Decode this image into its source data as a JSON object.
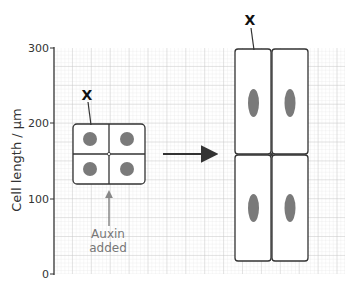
{
  "axis": {
    "ylabel": "Cell length / µm",
    "ticks": [
      "0",
      "100",
      "200",
      "300"
    ]
  },
  "labels": {
    "x_small": "X",
    "x_large": "X",
    "auxin_line1": "Auxin",
    "auxin_line2": "added"
  },
  "colors": {
    "grid_minor": "#e2e2e2",
    "grid_major": "#bdbdbd",
    "cell_border": "#333333",
    "nucleus": "#7a7a7a",
    "axis": "#333333"
  },
  "diagram": {
    "before": {
      "cells": 4,
      "arrangement": "2x2",
      "cell_length_um": 40,
      "nucleus_shape": "round"
    },
    "after": {
      "cells": 4,
      "arrangement": "2x2",
      "cell_length_um": 140,
      "nucleus_shape": "elongated"
    },
    "transition": "arrow"
  }
}
